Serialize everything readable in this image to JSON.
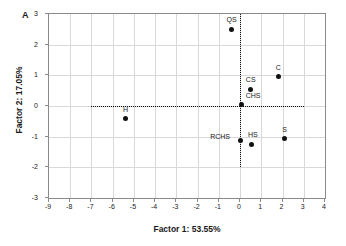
{
  "panel": {
    "letter": "A"
  },
  "chart_data": {
    "type": "scatter",
    "title": "",
    "xlabel": "Factor 1: 53.55%",
    "ylabel": "Factor 2: 17.05%",
    "xlim": [
      -9,
      4
    ],
    "ylim": [
      -3,
      3
    ],
    "xticks": [
      -9,
      -8,
      -7,
      -6,
      -5,
      -4,
      -3,
      -2,
      -1,
      0,
      1,
      2,
      3,
      4
    ],
    "xtick_labels": [
      "-9",
      "-8",
      "-7",
      "-6",
      "-5",
      "-4",
      "-3",
      "-2",
      "-1",
      "0",
      "1",
      "2",
      "3",
      "4"
    ],
    "yticks": [
      -3,
      -2,
      -1,
      0,
      1,
      2,
      3
    ],
    "ytick_labels": [
      "-3",
      "-2",
      "-1",
      "0",
      "1",
      "2",
      "3"
    ],
    "grid": true,
    "legend": "none",
    "marker_color": "#111111",
    "reference_lines": [
      {
        "orientation": "vertical",
        "value": 0,
        "from": -2,
        "to": 3,
        "style": "dotted"
      },
      {
        "orientation": "horizontal",
        "value": 0,
        "from": -7,
        "to": 3,
        "style": "dotted"
      }
    ],
    "points": [
      {
        "label": "QS",
        "x": -0.4,
        "y": 2.5,
        "label_dx": 0,
        "label_dy": -9
      },
      {
        "label": "C",
        "x": 1.8,
        "y": 0.95,
        "label_dx": 0,
        "label_dy": -9
      },
      {
        "label": "CS",
        "x": 0.5,
        "y": 0.55,
        "label_dx": 0,
        "label_dy": -9
      },
      {
        "label": "CHS",
        "x": 0.05,
        "y": 0.05,
        "label_dx": 12,
        "label_dy": -8
      },
      {
        "label": "H",
        "x": -5.4,
        "y": -0.42,
        "label_dx": 0,
        "label_dy": -9
      },
      {
        "label": "RCHS",
        "x": 0.0,
        "y": -1.12,
        "label_dx": -20,
        "label_dy": -3
      },
      {
        "label": "HS",
        "x": 0.55,
        "y": -1.25,
        "label_dx": 1,
        "label_dy": -9
      },
      {
        "label": "S",
        "x": 2.1,
        "y": -1.07,
        "label_dx": 0,
        "label_dy": -9
      }
    ]
  }
}
